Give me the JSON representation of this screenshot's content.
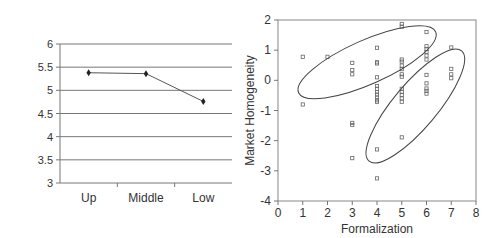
{
  "chart_data": [
    {
      "type": "line",
      "title": "",
      "xlabel": "",
      "ylabel": "",
      "categories": [
        "Up",
        "Middle",
        "Low"
      ],
      "values": [
        5.38,
        5.36,
        4.76
      ],
      "ylim": [
        3,
        6
      ],
      "yticks": [
        "3",
        "3.5",
        "4",
        "4.5",
        "5",
        "5.5",
        "6"
      ],
      "grid": true,
      "legend": null,
      "marker": "diamond",
      "line_color": "#555555"
    },
    {
      "type": "scatter",
      "title": "",
      "xlabel": "Formalization",
      "ylabel": "Market Homogeneity",
      "xlim": [
        0,
        8
      ],
      "ylim": [
        -4,
        2
      ],
      "xticks": [
        "0",
        "1",
        "2",
        "3",
        "4",
        "5",
        "6",
        "7",
        "8"
      ],
      "yticks": [
        "-4",
        "-3",
        "-2",
        "-1",
        "0",
        "1",
        "2"
      ],
      "grid": false,
      "legend": null,
      "marker": "open-square",
      "points": [
        [
          1,
          0.78
        ],
        [
          1,
          -0.8
        ],
        [
          2,
          0.78
        ],
        [
          3,
          0.58
        ],
        [
          3,
          0.34
        ],
        [
          3,
          0.2
        ],
        [
          3,
          -1.41
        ],
        [
          3,
          -1.48
        ],
        [
          3,
          -2.58
        ],
        [
          4,
          1.08
        ],
        [
          4,
          0.6
        ],
        [
          4,
          0.56
        ],
        [
          4,
          0.1
        ],
        [
          4,
          -0.19
        ],
        [
          4,
          -0.28
        ],
        [
          4,
          -0.39
        ],
        [
          4,
          -0.47
        ],
        [
          4,
          -0.57
        ],
        [
          4,
          -0.66
        ],
        [
          4,
          -0.71
        ],
        [
          4,
          -2.29
        ],
        [
          4,
          -3.25
        ],
        [
          5,
          1.87
        ],
        [
          5,
          1.78
        ],
        [
          5,
          0.69
        ],
        [
          5,
          0.62
        ],
        [
          5,
          0.49
        ],
        [
          5,
          0.37
        ],
        [
          5,
          0.2
        ],
        [
          5,
          0.12
        ],
        [
          5,
          -0.28
        ],
        [
          5,
          -0.38
        ],
        [
          5,
          -0.48
        ],
        [
          5,
          -0.6
        ],
        [
          5,
          -0.71
        ],
        [
          5,
          -1.89
        ],
        [
          6,
          1.6
        ],
        [
          6,
          1.13
        ],
        [
          6,
          1.04
        ],
        [
          6,
          0.94
        ],
        [
          6,
          0.82
        ],
        [
          6,
          0.69
        ],
        [
          6,
          0.18
        ],
        [
          6,
          -0.1
        ],
        [
          6,
          -0.27
        ],
        [
          6,
          -0.35
        ],
        [
          6,
          -0.44
        ],
        [
          7,
          1.09
        ],
        [
          7,
          0.38
        ],
        [
          7,
          0.2
        ],
        [
          7,
          0.07
        ]
      ],
      "annotations": [
        {
          "type": "ellipse",
          "description": "upper cluster",
          "center": [
            3.6,
            0.6
          ],
          "rx_data": 2.9,
          "ry_data": 0.85,
          "angle_deg": -20
        },
        {
          "type": "ellipse",
          "description": "lower cluster",
          "center": [
            5.5,
            -0.85
          ],
          "rx_data": 2.75,
          "ry_data": 0.75,
          "angle_deg": -47
        }
      ]
    }
  ]
}
